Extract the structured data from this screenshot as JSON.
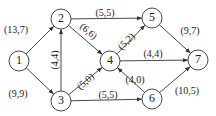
{
  "diagram": {
    "type": "directed-network-flow",
    "nodes": [
      {
        "id": "1",
        "label": "1",
        "x": 19,
        "y": 61
      },
      {
        "id": "2",
        "label": "2",
        "x": 61,
        "y": 19
      },
      {
        "id": "3",
        "label": "3",
        "x": 61,
        "y": 101
      },
      {
        "id": "4",
        "label": "4",
        "x": 110,
        "y": 61
      },
      {
        "id": "5",
        "label": "5",
        "x": 152,
        "y": 18
      },
      {
        "id": "6",
        "label": "6",
        "x": 152,
        "y": 99
      },
      {
        "id": "7",
        "label": "7",
        "x": 198,
        "y": 60
      }
    ],
    "edges": [
      {
        "from": "1",
        "to": "2",
        "label": "(13,7)",
        "lx": 16,
        "ly": 31,
        "rot": 0
      },
      {
        "from": "1",
        "to": "3",
        "label": "(9,9)",
        "lx": 18,
        "ly": 95,
        "rot": 0
      },
      {
        "from": "3",
        "to": "2",
        "label": "(4,4)",
        "lx": 56,
        "ly": 60,
        "rot": -90
      },
      {
        "from": "2",
        "to": "5",
        "label": "(5,5)",
        "lx": 105,
        "ly": 14,
        "rot": 0
      },
      {
        "from": "2",
        "to": "4",
        "label": "(6,6)",
        "lx": 88,
        "ly": 32,
        "rot": 40
      },
      {
        "from": "3",
        "to": "4",
        "label": "(5,0)",
        "lx": 86,
        "ly": 82,
        "rot": -42
      },
      {
        "from": "3",
        "to": "6",
        "label": "(5,5)",
        "lx": 108,
        "ly": 96,
        "rot": 0
      },
      {
        "from": "4",
        "to": "5",
        "label": "(5,2)",
        "lx": 127,
        "ly": 42,
        "rot": -45
      },
      {
        "from": "4",
        "to": "7",
        "label": "(4,4)",
        "lx": 153,
        "ly": 55,
        "rot": 0
      },
      {
        "from": "6",
        "to": "4",
        "label": "(4,0)",
        "lx": 135,
        "ly": 81,
        "rot": 0
      },
      {
        "from": "5",
        "to": "7",
        "label": "(9,7)",
        "lx": 190,
        "ly": 32,
        "rot": 0
      },
      {
        "from": "6",
        "to": "7",
        "label": "(10,5)",
        "lx": 187,
        "ly": 92,
        "rot": 0
      }
    ],
    "node_radius": 10,
    "colors": {
      "stroke": "#333333",
      "background": "#ffffff",
      "text": "#222222"
    }
  }
}
